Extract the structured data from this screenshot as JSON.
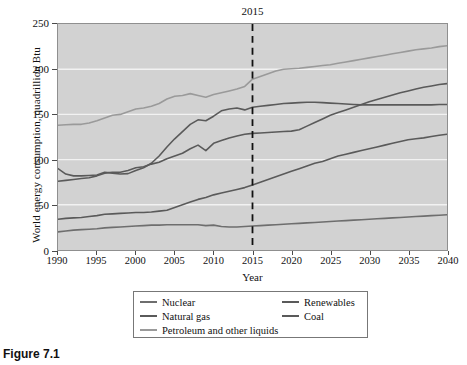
{
  "figure": {
    "caption": "Figure 7.1"
  },
  "chart_data": {
    "type": "line",
    "title": "",
    "xlabel": "Year",
    "ylabel": "World energy consumption, quadrillion Btu",
    "xlim": [
      1990,
      2040
    ],
    "ylim": [
      0,
      250
    ],
    "xticks": [
      1990,
      1995,
      2000,
      2005,
      2010,
      2015,
      2020,
      2025,
      2030,
      2035,
      2040
    ],
    "yticks": [
      0,
      50,
      100,
      150,
      200,
      250
    ],
    "grid": "horizontal",
    "legend_position": "below-outside",
    "annotations": [
      {
        "name": "projection-divider",
        "label": "2015",
        "x": 2015,
        "style": "dashed-vertical"
      }
    ],
    "x": [
      1990,
      1991,
      1992,
      1993,
      1994,
      1995,
      1996,
      1997,
      1998,
      1999,
      2000,
      2001,
      2002,
      2003,
      2004,
      2005,
      2006,
      2007,
      2008,
      2009,
      2010,
      2011,
      2012,
      2013,
      2014,
      2015,
      2016,
      2017,
      2018,
      2019,
      2020,
      2021,
      2022,
      2023,
      2024,
      2025,
      2026,
      2027,
      2028,
      2029,
      2030,
      2031,
      2032,
      2033,
      2034,
      2035,
      2036,
      2037,
      2038,
      2039,
      2040
    ],
    "series": [
      {
        "name": "Petroleum and other liquids",
        "color": "#9a9a9a",
        "values": [
          138,
          138.5,
          139,
          139,
          140.5,
          143,
          146,
          149,
          150,
          153,
          156,
          157,
          159,
          162,
          167,
          170,
          171,
          173,
          171,
          169,
          172,
          174,
          176,
          178,
          181,
          189,
          192,
          195,
          198,
          200,
          200.5,
          201,
          202,
          203,
          204,
          205,
          206.5,
          208,
          209.5,
          211,
          212.5,
          214,
          215.5,
          217,
          218.5,
          220,
          221.5,
          222.5,
          223.5,
          225,
          226
        ]
      },
      {
        "name": "Coal",
        "color": "#5a5a5a",
        "values": [
          90,
          84,
          82,
          82,
          82.5,
          83,
          86,
          85,
          84,
          84.5,
          88,
          91,
          96,
          104,
          114,
          123,
          131,
          139,
          144,
          143,
          148,
          154,
          156,
          157,
          155,
          158,
          159,
          160,
          161,
          162,
          162.5,
          163,
          163.5,
          163.5,
          163,
          162.5,
          162,
          161.5,
          161,
          160.5,
          160.5,
          160.5,
          160.5,
          160.5,
          160.5,
          160.5,
          160.5,
          160.5,
          160.5,
          161,
          161
        ]
      },
      {
        "name": "Natural gas",
        "color": "#5a5a5a",
        "values": [
          76,
          77,
          78,
          79,
          80,
          82,
          85,
          86,
          86,
          88,
          91,
          92,
          95,
          97,
          101,
          104,
          107,
          112,
          116,
          110,
          118,
          121,
          124,
          126,
          128,
          129,
          129.5,
          130,
          130.5,
          131,
          131.5,
          133,
          137,
          141,
          145,
          149,
          152,
          155,
          158,
          161,
          164,
          166.5,
          169,
          171.5,
          174,
          176,
          178,
          180,
          181.5,
          183,
          184
        ]
      },
      {
        "name": "Renewables",
        "color": "#5a5a5a",
        "values": [
          34,
          35,
          35.5,
          36,
          37,
          38,
          39.5,
          40,
          40.5,
          41,
          41.5,
          41.5,
          42,
          43,
          44,
          47,
          50,
          53,
          56,
          58,
          61,
          63,
          65,
          67,
          69,
          72,
          75,
          78,
          81,
          84,
          87,
          90,
          93,
          96,
          98,
          101,
          104,
          106,
          108,
          110,
          112,
          114,
          116,
          118,
          120,
          122,
          123,
          124,
          125.5,
          127,
          128
        ]
      },
      {
        "name": "Nuclear",
        "color": "#6e6e6e",
        "values": [
          20,
          21,
          22,
          22.5,
          23,
          23.5,
          24.5,
          25,
          25.5,
          26,
          26.5,
          27,
          27.5,
          27.5,
          28,
          28,
          28,
          28,
          28,
          27,
          27.5,
          26,
          25.5,
          25.5,
          26,
          26.5,
          27,
          27.5,
          28,
          28.5,
          29,
          29.5,
          30,
          30.5,
          31,
          31.5,
          32,
          32.5,
          33,
          33.5,
          34,
          34.5,
          35,
          35.5,
          36,
          36.5,
          37,
          37.5,
          38,
          38.5,
          39
        ]
      }
    ]
  },
  "legend": {
    "columns": [
      {
        "items": [
          {
            "label": "Nuclear",
            "color": "#6e6e6e"
          },
          {
            "label": "Natural gas",
            "color": "#5a5a5a"
          },
          {
            "label": "Petroleum and other liquids",
            "color": "#9a9a9a"
          }
        ]
      },
      {
        "items": [
          {
            "label": "Renewables",
            "color": "#5a5a5a"
          },
          {
            "label": "Coal",
            "color": "#5a5a5a"
          }
        ]
      }
    ]
  }
}
